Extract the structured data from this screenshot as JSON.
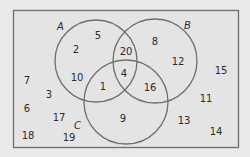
{
  "diagram": {
    "type": "venn",
    "sets": [
      {
        "label": "A",
        "cx": 96,
        "cy": 61,
        "r": 41,
        "label_x": 57,
        "label_y": 30
      },
      {
        "label": "B",
        "cx": 155,
        "cy": 61,
        "r": 42,
        "label_x": 184,
        "label_y": 29
      },
      {
        "label": "C",
        "cx": 126,
        "cy": 102,
        "r": 42,
        "label_x": 74,
        "label_y": 129
      }
    ],
    "regions": {
      "A_only": [
        2,
        5,
        10
      ],
      "B_only": [
        8,
        12
      ],
      "C_only": [
        9
      ],
      "A_and_B_only": [
        20
      ],
      "A_and_C_only": [
        1
      ],
      "B_and_C_only": [
        16
      ],
      "A_and_B_and_C": [
        4
      ],
      "outside": [
        7,
        3,
        6,
        17,
        18,
        19,
        15,
        11,
        13,
        14
      ]
    },
    "numbers": [
      {
        "v": "5",
        "x": 98,
        "y": 39
      },
      {
        "v": "2",
        "x": 76,
        "y": 53
      },
      {
        "v": "10",
        "x": 77,
        "y": 81
      },
      {
        "v": "20",
        "x": 126,
        "y": 55
      },
      {
        "v": "8",
        "x": 155,
        "y": 45
      },
      {
        "v": "12",
        "x": 178,
        "y": 65
      },
      {
        "v": "4",
        "x": 124,
        "y": 77
      },
      {
        "v": "1",
        "x": 103,
        "y": 90
      },
      {
        "v": "16",
        "x": 150,
        "y": 91
      },
      {
        "v": "9",
        "x": 123,
        "y": 122
      },
      {
        "v": "7",
        "x": 27,
        "y": 84
      },
      {
        "v": "3",
        "x": 49,
        "y": 98
      },
      {
        "v": "6",
        "x": 27,
        "y": 112
      },
      {
        "v": "17",
        "x": 59,
        "y": 121
      },
      {
        "v": "18",
        "x": 28,
        "y": 139
      },
      {
        "v": "19",
        "x": 69,
        "y": 141
      },
      {
        "v": "15",
        "x": 221,
        "y": 74
      },
      {
        "v": "11",
        "x": 206,
        "y": 102
      },
      {
        "v": "13",
        "x": 184,
        "y": 124
      },
      {
        "v": "14",
        "x": 216,
        "y": 135
      }
    ],
    "colors": {
      "background": "#e9e9e9",
      "panel": "#e4e4e4",
      "stroke": "#6e6e6e",
      "text": "#2b2b2b"
    }
  }
}
